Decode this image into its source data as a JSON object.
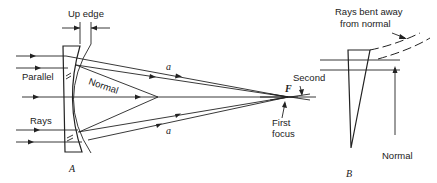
{
  "panel_a": {
    "label": "A",
    "up_edge_label": "Up edge",
    "parallel_label": "Parallel",
    "rays_label": "Rays",
    "normal_label": "Normal",
    "ray_label_top": "a",
    "ray_label_bottom": "a",
    "focus_symbol": "F",
    "second_label": "Second",
    "first_focus_label_line1": "First",
    "first_focus_label_line2": "focus"
  },
  "panel_b": {
    "label": "B",
    "rays_bent_line1": "Rays bent away",
    "rays_bent_line2": "from normal",
    "normal_label": "Normal"
  }
}
